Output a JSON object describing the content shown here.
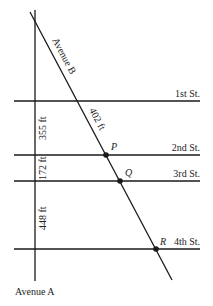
{
  "diagram": {
    "avenues": {
      "a": {
        "label": "Avenue A"
      },
      "b": {
        "label": "Avenue B"
      }
    },
    "streets": [
      {
        "label": "1st St."
      },
      {
        "label": "2nd St."
      },
      {
        "label": "3rd St."
      },
      {
        "label": "4th St."
      }
    ],
    "points": [
      {
        "label": "P"
      },
      {
        "label": "Q"
      },
      {
        "label": "R"
      }
    ],
    "measurements": {
      "ave_b_1st_to_2nd": "402 ft",
      "ave_a_1st_to_2nd": "355 ft",
      "ave_a_2nd_to_3rd": "172 ft",
      "ave_a_3rd_to_4th": "448 ft"
    },
    "colors": {
      "line": "#1a1a1a",
      "text": "#222222"
    }
  }
}
